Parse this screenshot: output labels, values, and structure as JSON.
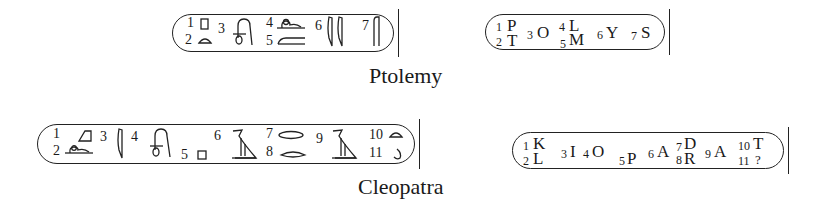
{
  "ptolemy": {
    "caption": "Ptolemy",
    "hieroglyph_cartouche": {
      "labels": [
        "1",
        "2",
        "3",
        "4",
        "5",
        "6",
        "7"
      ],
      "signs": [
        "square-stool-icon",
        "bread-loaf-icon",
        "lasso-loop-icon",
        "lion-icon",
        "mouth-bar-icon",
        "double-reed-icon",
        "folded-cloth-icon"
      ]
    },
    "transliteration_cartouche": {
      "items": [
        {
          "n": "1",
          "letter": "P"
        },
        {
          "n": "2",
          "letter": "T"
        },
        {
          "n": "3",
          "letter": "O"
        },
        {
          "n": "4",
          "letter": "L"
        },
        {
          "n": "5",
          "letter": "M"
        },
        {
          "n": "6",
          "letter": "Y"
        },
        {
          "n": "7",
          "letter": "S"
        }
      ]
    }
  },
  "cleopatra": {
    "caption": "Cleopatra",
    "hieroglyph_cartouche": {
      "labels": [
        "1",
        "2",
        "3",
        "4",
        "5",
        "6",
        "7",
        "8",
        "9",
        "10",
        "11"
      ],
      "signs": [
        "basket-triangle-icon",
        "lion-icon",
        "reed-icon",
        "lasso-loop-icon",
        "square-stool-icon",
        "vulture-icon",
        "mouth-icon",
        "hand-icon",
        "vulture-icon",
        "bread-loaf-icon",
        "egg-icon"
      ]
    },
    "transliteration_cartouche": {
      "items": [
        {
          "n": "1",
          "letter": "K"
        },
        {
          "n": "2",
          "letter": "L"
        },
        {
          "n": "3",
          "letter": "I"
        },
        {
          "n": "4",
          "letter": "O"
        },
        {
          "n": "5",
          "letter": "P"
        },
        {
          "n": "6",
          "letter": "A"
        },
        {
          "n": "7",
          "letter": "D"
        },
        {
          "n": "8",
          "letter": "R"
        },
        {
          "n": "9",
          "letter": "A"
        },
        {
          "n": "10",
          "letter": "T"
        },
        {
          "n": "11",
          "letter": "?"
        }
      ]
    }
  }
}
